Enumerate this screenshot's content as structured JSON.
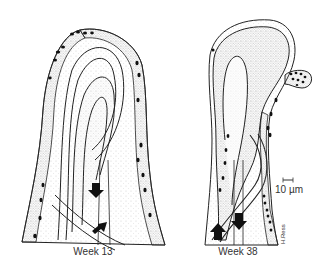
{
  "figure": {
    "panels": [
      {
        "id": "left",
        "caption": "Week 13"
      },
      {
        "id": "right",
        "caption": "Week 38"
      }
    ],
    "scale_bar": {
      "label": "10 µm"
    },
    "signature": "H.Ress",
    "colors": {
      "ink": "#1a1a1a",
      "stipple": "#bdbdbd",
      "background": "#ffffff"
    }
  }
}
